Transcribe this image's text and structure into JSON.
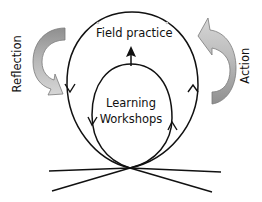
{
  "diagram": {
    "type": "cyclic process diagram",
    "labels": {
      "outer_loop": "Field practice",
      "inner_loop_line1": "Learning",
      "inner_loop_line2": "Workshops",
      "left_arrow": "Reflection",
      "right_arrow": "Action"
    },
    "elements": [
      {
        "id": "outer-loop",
        "shape": "ellipse-loop",
        "label": "Field practice",
        "direction": "down left side, up right side"
      },
      {
        "id": "inner-loop",
        "shape": "ellipse-loop",
        "label": "Learning Workshops",
        "direction": "down left side, up right side"
      },
      {
        "id": "reflection-arrow",
        "shape": "curved block arrow",
        "label": "Reflection",
        "side": "left",
        "points": "down"
      },
      {
        "id": "action-arrow",
        "shape": "curved block arrow",
        "label": "Action",
        "side": "right",
        "points": "up"
      },
      {
        "id": "up-arrow",
        "shape": "arrow",
        "from": "inner-loop top",
        "to": "Field practice"
      },
      {
        "id": "base-lines",
        "shape": "crossing lines",
        "count": 4,
        "meet_at": "loops' base point"
      }
    ],
    "colors": {
      "stroke": "#111111",
      "arrow_fill_dark": "#9a9a9a",
      "arrow_fill_light": "#cfcfcf",
      "arrow_stroke": "#6e6e6e",
      "background": "#ffffff"
    }
  }
}
